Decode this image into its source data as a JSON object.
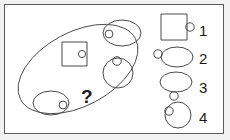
{
  "puzzle": {
    "title": "Visual analogy puzzle",
    "question_mark": "?",
    "container": {
      "name": "large-tilted-ellipse",
      "shape": "ellipse",
      "rotation_deg": -28
    },
    "container_items": [
      {
        "id": "item-square",
        "outer_shape": "square",
        "inner_dot": "circle",
        "dot_position": "inside-right"
      },
      {
        "id": "item-ellipse-top",
        "outer_shape": "ellipse",
        "inner_dot": "circle",
        "dot_position": "inside-left"
      },
      {
        "id": "item-circle-right",
        "outer_shape": "circle",
        "inner_dot": "circle",
        "dot_position": "inside-top"
      },
      {
        "id": "item-ellipse-bottom",
        "outer_shape": "ellipse",
        "inner_dot": "circle",
        "dot_position": "inside-right"
      }
    ],
    "options": [
      {
        "number": "1",
        "outer_shape": "square",
        "dot_shape": "circle",
        "dot_position": "outside-right"
      },
      {
        "number": "2",
        "outer_shape": "ellipse",
        "dot_shape": "circle",
        "dot_position": "outside-left"
      },
      {
        "number": "3",
        "outer_shape": "ellipse",
        "dot_shape": "circle",
        "dot_position": "outside-bottom"
      },
      {
        "number": "4",
        "outer_shape": "circle",
        "dot_shape": "circle",
        "dot_position": "inside-upper-left"
      }
    ],
    "colors": {
      "stroke": "#4a4a4a",
      "text": "#1a1a1a",
      "frame_border": "#5b5b5b",
      "page_background": "#f2f2f2",
      "panel_background": "#ffffff"
    }
  }
}
